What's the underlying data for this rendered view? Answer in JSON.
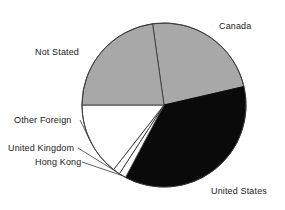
{
  "chart_data": {
    "type": "pie",
    "title": "",
    "subtitle": "",
    "xlabel": "",
    "ylabel": "",
    "grid": false,
    "legend_position": "none",
    "label_placement": "outside-callout",
    "categories": [
      "Canada",
      "United States",
      "Hong Kong",
      "United Kingdom",
      "Other Foreign",
      "Not Stated"
    ],
    "values": [
      23.6,
      36.4,
      1.4,
      1.4,
      14.4,
      22.8
    ],
    "units": "percent",
    "start_angle_deg": -8,
    "direction": "clockwise",
    "slices": [
      {
        "label": "Canada",
        "value": 23.6,
        "start_deg": -8,
        "end_deg": 77,
        "color": "#a8a8a8",
        "stroke": "#3a3a3a"
      },
      {
        "label": "United States",
        "value": 36.4,
        "start_deg": 77,
        "end_deg": 208,
        "color": "#0a0a0a",
        "stroke": "#0a0a0a"
      },
      {
        "label": "Hong Kong",
        "value": 1.4,
        "start_deg": 208,
        "end_deg": 213,
        "color": "#ffffff",
        "stroke": "#3a3a3a"
      },
      {
        "label": "United Kingdom",
        "value": 1.4,
        "start_deg": 213,
        "end_deg": 218,
        "color": "#ffffff",
        "stroke": "#3a3a3a"
      },
      {
        "label": "Other Foreign",
        "value": 14.4,
        "start_deg": 218,
        "end_deg": 270,
        "color": "#ffffff",
        "stroke": "#3a3a3a"
      },
      {
        "label": "Not Stated",
        "value": 22.8,
        "start_deg": 270,
        "end_deg": 352,
        "color": "#a8a8a8",
        "stroke": "#3a3a3a"
      }
    ],
    "colors": {
      "grey_slice": "#a8a8a8",
      "black_slice": "#0a0a0a",
      "white_slice": "#ffffff",
      "outline": "#3a3a3a",
      "background": "#ffffff",
      "label_text": "#1a1a1a"
    },
    "geometry": {
      "center_x": 164,
      "center_y": 105,
      "radius": 82
    }
  },
  "labels": {
    "canada": "Canada",
    "united_states": "United States",
    "hong_kong": "Hong Kong",
    "united_kingdom": "United Kingdom",
    "other_foreign": "Other Foreign",
    "not_stated": "Not Stated"
  }
}
